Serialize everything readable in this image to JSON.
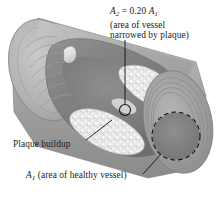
{
  "figure": {
    "name": "atherosclerotic-blood-vessel-cross-section",
    "background_color": "#ffffff"
  },
  "annotations": {
    "narrowed_area": {
      "symbol": "A",
      "symbol_subscript": "2",
      "equation_rest": " = 0.20 ",
      "reference_symbol": "A",
      "reference_subscript": "1",
      "line2": "(area of vessel",
      "line3": "narrowed by plaque)",
      "full_text": "A2 = 0.20 A1 (area of vessel narrowed by plaque)"
    },
    "plaque": {
      "text": "Plaque buildup"
    },
    "healthy_area": {
      "symbol": "A",
      "symbol_subscript": "1",
      "rest": " (area of healthy vessel)",
      "full_text": "A1 (area of healthy vessel)"
    }
  },
  "colors": {
    "outer_wall": "#a9a9a9",
    "outer_wall_light": "#c2c2c2",
    "outer_wall_dark": "#8d8d8d",
    "interior_shadow": "#8a8a8a",
    "interior_deep": "#6f6f6f",
    "plaque_light": "#e9e9e9",
    "plaque_mid": "#d2d2d2",
    "line": "#1a1a1a",
    "end_face": "#9c9c9c"
  },
  "markers": {
    "narrowed_circle": {
      "shape": "small-circle",
      "cx": 125,
      "cy": 110,
      "r": 5.5,
      "style": "solid"
    },
    "healthy_circle": {
      "shape": "large-circle",
      "cx": 176,
      "cy": 136,
      "r": 24,
      "style": "dashed"
    }
  }
}
